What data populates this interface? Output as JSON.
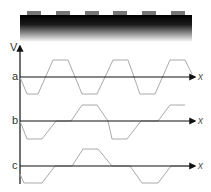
{
  "figure": {
    "axis_label_v": "V",
    "axis_label_x": "x",
    "rows": [
      {
        "label": "a"
      },
      {
        "label": "b"
      },
      {
        "label": "c"
      }
    ]
  },
  "colors": {
    "axis": "#111111",
    "wave": "#aaaaaa",
    "bump": "#777777",
    "bar_top": "#000000"
  }
}
